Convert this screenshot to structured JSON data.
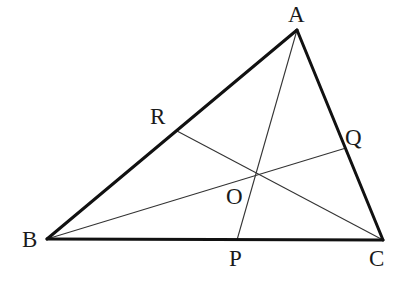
{
  "diagram": {
    "type": "geometry",
    "vertices": {
      "A": {
        "label": "A",
        "x": 297,
        "y": 30
      },
      "B": {
        "label": "B",
        "x": 47,
        "y": 239
      },
      "C": {
        "label": "C",
        "x": 383,
        "y": 240
      }
    },
    "side_points": {
      "R": {
        "label": "R",
        "on": "AB",
        "x": 177,
        "y": 131
      },
      "Q": {
        "label": "Q",
        "on": "AC",
        "x": 346,
        "y": 148
      },
      "P": {
        "label": "P",
        "on": "BC",
        "x": 237,
        "y": 240
      }
    },
    "concurrency_point": {
      "label": "O",
      "x": 257,
      "y": 173
    },
    "segments": {
      "sides": [
        "AB",
        "BC",
        "CA"
      ],
      "cevians": [
        "AP",
        "BQ",
        "CR"
      ]
    },
    "labels": {
      "A": "A",
      "B": "B",
      "C": "C",
      "P": "P",
      "Q": "Q",
      "R": "R",
      "O": "O"
    },
    "colors": {
      "background": "#ffffff",
      "lines": "#111111",
      "text": "#1a1a1a"
    }
  }
}
